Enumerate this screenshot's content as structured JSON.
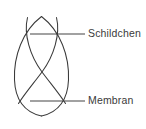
{
  "figure": {
    "type": "labeled-line-diagram",
    "background_color": "#ffffff",
    "stroke_color": "#3a3a3a",
    "text_color": "#3a3a3a",
    "width": 146,
    "height": 129,
    "labels": [
      {
        "id": "schildchen",
        "text": "Schildchen",
        "leader_line": {
          "x1": 30,
          "y1": 34,
          "x2": 85,
          "y2": 34
        }
      },
      {
        "id": "membran",
        "text": "Membran",
        "leader_line": {
          "x1": 30,
          "y1": 101,
          "x2": 85,
          "y2": 101
        }
      }
    ],
    "shapes": {
      "outer_outline": "vertical pointed oval",
      "inner_crossing_arcs": "two arcs crossing in an X near the centre",
      "crossing_point": {
        "x": 42,
        "y": 62
      },
      "bounds": {
        "left": 13,
        "right": 70,
        "top": 16,
        "bottom": 116
      }
    },
    "caption_cut_off": ""
  }
}
